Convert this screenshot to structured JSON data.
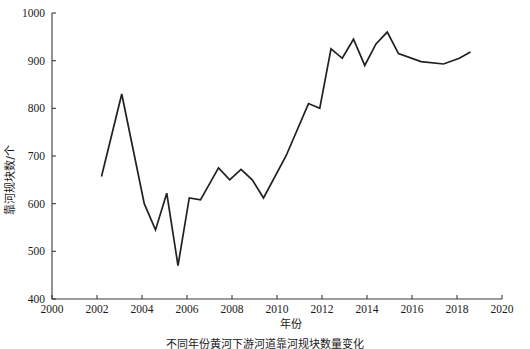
{
  "chart_data": {
    "type": "line",
    "title": "",
    "xlabel": "年份",
    "ylabel": "靠河规块数/个",
    "xlim": [
      2000,
      2020
    ],
    "ylim": [
      400,
      1000
    ],
    "xticks": [
      2000,
      2002,
      2004,
      2006,
      2008,
      2010,
      2012,
      2014,
      2016,
      2018,
      2020
    ],
    "yticks": [
      400,
      500,
      600,
      700,
      800,
      900,
      1000
    ],
    "grid": false,
    "legend": null,
    "line_color": "#231f20",
    "series": [
      {
        "name": "靠河规块数",
        "x": [
          2002.2,
          2003.1,
          2004.1,
          2004.6,
          2005.1,
          2005.6,
          2006.1,
          2006.6,
          2007.4,
          2007.9,
          2008.4,
          2008.9,
          2009.4,
          2010.4,
          2011.4,
          2011.9,
          2012.4,
          2012.9,
          2013.4,
          2013.9,
          2014.4,
          2014.9,
          2015.4,
          2016.4,
          2017.4,
          2018.1,
          2018.6
        ],
        "y": [
          657,
          830,
          600,
          545,
          622,
          470,
          612,
          608,
          675,
          650,
          672,
          650,
          612,
          700,
          810,
          800,
          925,
          905,
          945,
          890,
          935,
          960,
          915,
          898,
          893,
          905,
          918
        ]
      }
    ],
    "caption": "不同年份黄河下游河道靠河规块数量变化"
  }
}
